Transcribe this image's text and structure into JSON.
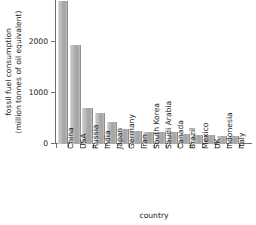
{
  "chart_data": {
    "type": "bar",
    "title": "",
    "subtitle": "",
    "xlabel": "country",
    "ylabel": "fossil fuel consumption (million tonnes of oil equivalent)",
    "ylabel_line1": "fossil fuel consumption",
    "ylabel_line2": "(million tonnes of oil equivalent)",
    "categories": [
      "China",
      "USA",
      "Russia",
      "India",
      "Japan",
      "Germany",
      "Iran",
      "South Korea",
      "Saudi Arabia",
      "Canada",
      "Brazil",
      "Mexico",
      "UK",
      "Indonesia",
      "Italy"
    ],
    "values": [
      2800,
      1950,
      700,
      600,
      430,
      300,
      250,
      240,
      235,
      230,
      200,
      180,
      170,
      165,
      150
    ],
    "ylim": [
      0,
      2820
    ],
    "yticks": [
      0,
      1000,
      2000
    ],
    "ytick_labels": [
      "0",
      "1000",
      "2000"
    ],
    "grid": false,
    "legend": null,
    "bar_color": "#ababab",
    "axis_color": "#6e6e6e",
    "text_color": "#1a1a1a",
    "note": "tallest bar (China) is clipped by the top edge of the plot area"
  }
}
